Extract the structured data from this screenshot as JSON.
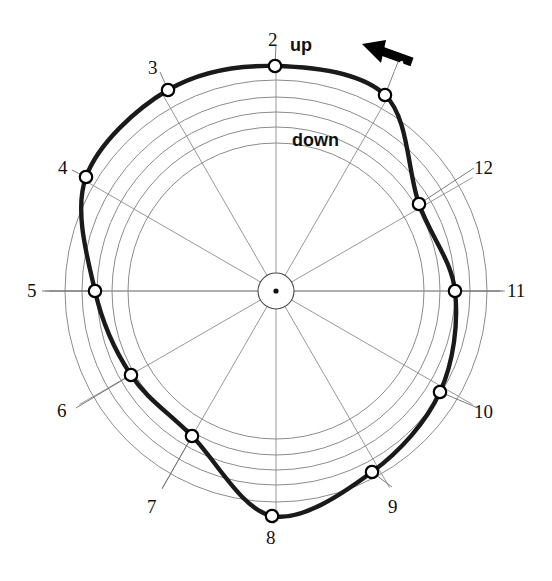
{
  "figure": {
    "type": "polar-profile-diagram",
    "background": "#ffffff",
    "grid_color": "#8c8c8c",
    "profile_color": "#1a1a1a",
    "marker_color": "#000000"
  },
  "annotations": {
    "up": "up",
    "down": "down",
    "arrow_label": "A"
  },
  "chart_data": {
    "type": "line",
    "subtype": "polar",
    "title": "",
    "xlabel": "",
    "ylabel": "",
    "grid": true,
    "legend": false,
    "center": {
      "x": 276,
      "y": 291
    },
    "hub_radius": 18,
    "grid_radii": [
      148,
      164,
      179,
      194,
      211
    ],
    "axis_count": 12,
    "axis_labels": [
      "1",
      "2",
      "3",
      "4",
      "5",
      "6",
      "7",
      "8",
      "9",
      "10",
      "11",
      "12"
    ],
    "tick_labels": [
      "2",
      "3",
      "4",
      "5",
      "6",
      "7",
      "8",
      "9",
      "10",
      "11",
      "12"
    ],
    "theta_deg": [
      60,
      90,
      120,
      150,
      180,
      210,
      240,
      270,
      300,
      330,
      0,
      30
    ],
    "r": [
      195,
      225,
      208,
      214,
      181,
      161,
      167,
      225,
      203,
      192,
      179,
      168
    ],
    "points": [
      {
        "label": "1",
        "theta_deg": 60,
        "r": 195,
        "x": 385,
        "y": 95,
        "label_shown": false
      },
      {
        "label": "2",
        "theta_deg": 90,
        "r": 225,
        "x": 275,
        "y": 66,
        "label_shown": true
      },
      {
        "label": "3",
        "theta_deg": 120,
        "r": 208,
        "x": 168,
        "y": 90,
        "label_shown": true
      },
      {
        "label": "4",
        "theta_deg": 150,
        "r": 214,
        "x": 86,
        "y": 177,
        "label_shown": true
      },
      {
        "label": "5",
        "theta_deg": 180,
        "r": 181,
        "x": 95,
        "y": 291,
        "label_shown": true
      },
      {
        "label": "6",
        "theta_deg": 210,
        "r": 161,
        "x": 131,
        "y": 375,
        "label_shown": true
      },
      {
        "label": "7",
        "theta_deg": 240,
        "r": 167,
        "x": 192,
        "y": 436,
        "label_shown": true
      },
      {
        "label": "8",
        "theta_deg": 270,
        "r": 225,
        "x": 272,
        "y": 516,
        "label_shown": true
      },
      {
        "label": "9",
        "theta_deg": 300,
        "r": 203,
        "x": 372,
        "y": 472,
        "label_shown": true
      },
      {
        "label": "10",
        "theta_deg": 330,
        "r": 192,
        "x": 440,
        "y": 392,
        "label_shown": true
      },
      {
        "label": "11",
        "theta_deg": 0,
        "r": 179,
        "x": 455,
        "y": 291,
        "label_shown": true
      },
      {
        "label": "12",
        "theta_deg": 30,
        "r": 168,
        "x": 419,
        "y": 204,
        "label_shown": true
      }
    ],
    "tick_label_positions": [
      {
        "text": "2",
        "x": 268,
        "y": 30
      },
      {
        "text": "3",
        "x": 148,
        "y": 58
      },
      {
        "text": "4",
        "x": 58,
        "y": 158
      },
      {
        "text": "5",
        "x": 27,
        "y": 281
      },
      {
        "text": "6",
        "x": 57,
        "y": 401
      },
      {
        "text": "7",
        "x": 147,
        "y": 497
      },
      {
        "text": "8",
        "x": 266,
        "y": 528
      },
      {
        "text": "9",
        "x": 388,
        "y": 497
      },
      {
        "text": "10",
        "x": 474,
        "y": 402
      },
      {
        "text": "11",
        "x": 507,
        "y": 281
      },
      {
        "text": "12",
        "x": 474,
        "y": 158
      }
    ],
    "annotation_positions": [
      {
        "text": "up",
        "x": 290,
        "y": 36
      },
      {
        "text": "down",
        "x": 292,
        "y": 131
      },
      {
        "text": "A",
        "x": 395,
        "y": 58
      }
    ],
    "leader_lines": [
      {
        "from": [
          275,
          66
        ],
        "to": [
          276,
          45
        ]
      },
      {
        "from": [
          168,
          90
        ],
        "to": [
          160,
          72
        ]
      },
      {
        "from": [
          86,
          177
        ],
        "to": [
          72,
          170
        ]
      },
      {
        "from": [
          95,
          291
        ],
        "to": [
          42,
          291
        ]
      },
      {
        "from": [
          131,
          375
        ],
        "to": [
          76,
          408
        ]
      },
      {
        "from": [
          192,
          436
        ],
        "to": [
          162,
          489
        ]
      },
      {
        "from": [
          272,
          516
        ],
        "to": [
          274,
          524
        ]
      },
      {
        "from": [
          372,
          472
        ],
        "to": [
          392,
          487
        ]
      },
      {
        "from": [
          440,
          392
        ],
        "to": [
          478,
          408
        ]
      },
      {
        "from": [
          455,
          291
        ],
        "to": [
          500,
          291
        ]
      },
      {
        "from": [
          419,
          204
        ],
        "to": [
          474,
          168
        ]
      },
      {
        "from": [
          385,
          95
        ],
        "to": [
          398,
          62
        ]
      }
    ],
    "arrow": {
      "tail": [
        412,
        62
      ],
      "head": [
        362,
        44
      ],
      "direction_deg": 160
    }
  }
}
